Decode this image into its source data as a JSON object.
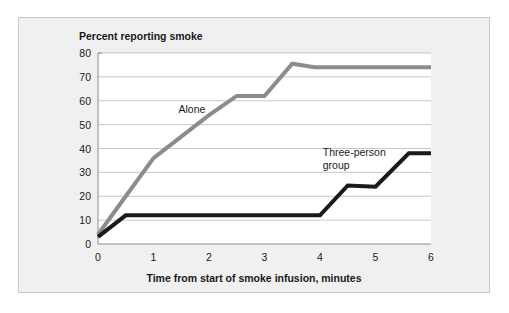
{
  "figure": {
    "background_color": "#f0f0f0",
    "plot_background_color": "#ffffff",
    "border_color": "#c8c8c8"
  },
  "chart_data": {
    "type": "line",
    "title": "Percent reporting smoke",
    "xlabel": "Time from start of smoke infusion, minutes",
    "ylabel": "Percent reporting smoke",
    "xlim": [
      0,
      6
    ],
    "ylim": [
      0,
      80
    ],
    "xticks": [
      "0",
      "1",
      "2",
      "3",
      "4",
      "5",
      "6"
    ],
    "xtick_values": [
      0,
      1,
      2,
      3,
      4,
      5,
      6
    ],
    "yticks": [
      "0",
      "10",
      "20",
      "30",
      "40",
      "50",
      "60",
      "70",
      "80"
    ],
    "ytick_values": [
      0,
      10,
      20,
      30,
      40,
      50,
      60,
      70,
      80
    ],
    "grid": "horizontal",
    "legend": "inline-annotations",
    "series": [
      {
        "name": "Alone",
        "color": "#8c8c8c",
        "width": 4.0,
        "label_x": 1.45,
        "label_y": 55,
        "x": [
          0,
          0.5,
          1.0,
          1.5,
          2.0,
          2.5,
          3.0,
          3.5,
          3.9,
          6.0
        ],
        "y": [
          4,
          20,
          36,
          45,
          54,
          62,
          62,
          75.5,
          74,
          74
        ]
      },
      {
        "name": "Three-person group",
        "color": "#1a1a1a",
        "width": 4.0,
        "label_x": 4.05,
        "label_y": 37,
        "label_line1": "Three-person",
        "label_line2": "group",
        "x": [
          0,
          0.5,
          4.0,
          4.5,
          5.0,
          5.6,
          6.0
        ],
        "y": [
          3,
          12,
          12,
          24.5,
          24,
          38,
          38
        ]
      }
    ]
  }
}
